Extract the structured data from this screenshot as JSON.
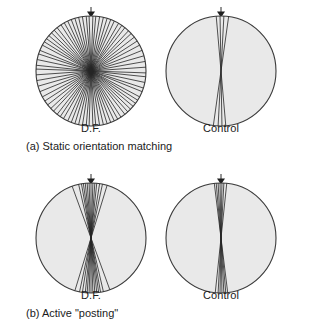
{
  "figure": {
    "marker_icon": "down-triangle-marker",
    "marker_meaning": "target orientation (vertical, 0 deg)",
    "circle_fill": "#e9e9e9",
    "circle_stroke": "#3a3a3a",
    "line_color": "#262626"
  },
  "panels": [
    {
      "id": "a",
      "caption": "(a) Static orientation matching",
      "plots": [
        {
          "id": "a-df",
          "label": "D.F."
        },
        {
          "id": "a-control",
          "label": "Control"
        }
      ]
    },
    {
      "id": "b",
      "caption": "(b) Active \"posting\"",
      "plots": [
        {
          "id": "b-df",
          "label": "D.F."
        },
        {
          "id": "b-control",
          "label": "Control"
        }
      ]
    }
  ],
  "chart_data": {
    "type": "polar-line-diameter-plots",
    "units": "degrees",
    "angle_convention": "0 = vertical (matches target marker at top); positive = clockwise tilt from vertical",
    "radius_px": 55,
    "plots": [
      {
        "id": "a-df",
        "panel": "a",
        "panel_label": "(a) Static orientation matching",
        "group": "D.F.",
        "marker_angle": 0,
        "n_lines": 40,
        "spread": "near-uniform, settings at essentially all orientations",
        "angles": [
          -88,
          -84,
          -78,
          -72,
          -68,
          -62,
          -58,
          -54,
          -50,
          -46,
          -42,
          -38,
          -33,
          -29,
          -25,
          -21,
          -17,
          -13,
          -9,
          -5,
          -2,
          2,
          5,
          9,
          13,
          17,
          21,
          25,
          30,
          34,
          38,
          43,
          47,
          52,
          57,
          62,
          68,
          74,
          80,
          86
        ]
      },
      {
        "id": "a-control",
        "panel": "a",
        "panel_label": "(a) Static orientation matching",
        "group": "Control",
        "marker_angle": 0,
        "n_lines": 4,
        "spread": "tight cluster close to vertical",
        "angles": [
          -5,
          -1,
          3,
          8
        ]
      },
      {
        "id": "b-df",
        "panel": "b",
        "panel_label": "(b) Active \"posting\"",
        "group": "D.F.",
        "marker_angle": 0,
        "n_lines": 14,
        "spread": "moderately tight fan about vertical, one outlier near -20 deg",
        "angles": [
          -20,
          -13,
          -10,
          -8,
          -6,
          -4,
          -2,
          0,
          2,
          4,
          6,
          9,
          12,
          17
        ]
      },
      {
        "id": "b-control",
        "panel": "b",
        "panel_label": "(b) Active \"posting\"",
        "group": "Control",
        "marker_angle": 0,
        "n_lines": 7,
        "spread": "very tight cluster at vertical",
        "angles": [
          -7,
          -5,
          -3,
          -1,
          1,
          3,
          6
        ]
      }
    ]
  }
}
